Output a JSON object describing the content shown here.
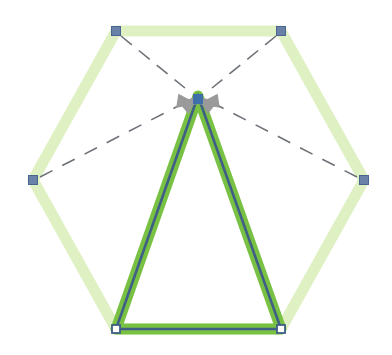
{
  "canvas": {
    "width": 392,
    "height": 355,
    "background": "#ffffff"
  },
  "colors": {
    "hexagon_edge": "#d9efb8",
    "hexagon_edge_opacity": "0.85",
    "triangle_fill_stroke": "#79c143",
    "triangle_core_stroke": "#3f5f86",
    "vertex_marker_fill": "#6b82a8",
    "vertex_marker_stroke": "#4a6690",
    "open_marker_stroke": "#3f5f86",
    "open_marker_fill": "#ffffff",
    "dashed_guide": "#6e7278",
    "arrow_head": "#9a9a9a",
    "apex_marker_fill": "#3f6fa8"
  },
  "shapes": {
    "hexagon": {
      "name": "hexagon",
      "stroke_width": 11,
      "points": [
        {
          "id": "hex-top-left",
          "x": 116,
          "y": 31
        },
        {
          "id": "hex-top-right",
          "x": 281,
          "y": 31
        },
        {
          "id": "hex-right",
          "x": 364,
          "y": 180
        },
        {
          "id": "hex-bottom-right",
          "x": 281,
          "y": 329
        },
        {
          "id": "hex-bottom-left",
          "x": 116,
          "y": 329
        },
        {
          "id": "hex-left",
          "x": 33,
          "y": 180
        }
      ]
    },
    "triangle": {
      "name": "triangle",
      "outer_stroke_width": 11,
      "inner_stroke_width": 2.6,
      "points": [
        {
          "id": "tri-apex",
          "x": 198,
          "y": 96
        },
        {
          "id": "tri-bottom-right",
          "x": 281,
          "y": 329
        },
        {
          "id": "tri-bottom-left",
          "x": 116,
          "y": 329
        }
      ]
    }
  },
  "vertex_markers": [
    {
      "id": "marker-hex-top-left",
      "x": 116,
      "y": 31,
      "size": 9,
      "style": "filled"
    },
    {
      "id": "marker-hex-top-right",
      "x": 281,
      "y": 31,
      "size": 9,
      "style": "filled"
    },
    {
      "id": "marker-hex-right",
      "x": 364,
      "y": 180,
      "size": 9,
      "style": "filled"
    },
    {
      "id": "marker-hex-left",
      "x": 33,
      "y": 180,
      "size": 9,
      "style": "filled"
    },
    {
      "id": "marker-tri-bottom-left",
      "x": 116,
      "y": 329,
      "size": 8,
      "style": "open"
    },
    {
      "id": "marker-tri-bottom-right",
      "x": 281,
      "y": 329,
      "size": 8,
      "style": "open"
    },
    {
      "id": "marker-tri-apex",
      "x": 198,
      "y": 99,
      "size": 9,
      "style": "apex"
    }
  ],
  "guides": [
    {
      "id": "guide-from-top-left",
      "x1": 121,
      "y1": 36,
      "x2": 185,
      "y2": 88,
      "dash": "14 9"
    },
    {
      "id": "guide-from-top-right",
      "x1": 276,
      "y1": 36,
      "x2": 212,
      "y2": 88,
      "dash": "14 9"
    },
    {
      "id": "guide-from-left",
      "x1": 40,
      "y1": 177,
      "x2": 186,
      "y2": 102,
      "dash": "14 11"
    },
    {
      "id": "guide-from-right",
      "x1": 357,
      "y1": 177,
      "x2": 211,
      "y2": 102,
      "dash": "14 11"
    }
  ],
  "arrows": [
    {
      "id": "arrow-converge-upper-left",
      "x": 198,
      "y": 96,
      "angle": -140,
      "length": 19,
      "width": 15
    },
    {
      "id": "arrow-converge-upper-right",
      "x": 198,
      "y": 96,
      "angle": -40,
      "length": 19,
      "width": 15
    },
    {
      "id": "arrow-converge-lower-left",
      "x": 198,
      "y": 104,
      "angle": 171,
      "length": 21,
      "width": 14
    },
    {
      "id": "arrow-converge-lower-right",
      "x": 198,
      "y": 104,
      "angle": 9,
      "length": 21,
      "width": 14
    }
  ],
  "legend": {
    "note": ""
  }
}
